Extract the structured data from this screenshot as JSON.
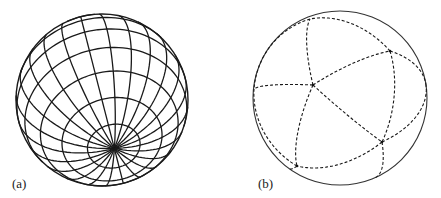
{
  "figure": {
    "panels": [
      {
        "id": "a",
        "label": "(a)",
        "description": "Sphere with latitude-longitude grid, pole tilted toward viewer",
        "meridian_count": 24,
        "parallel_count": 9
      },
      {
        "id": "b",
        "label": "(b)",
        "description": "Sphere partitioned by dashed great-circle arcs into spherical triangles"
      }
    ]
  }
}
